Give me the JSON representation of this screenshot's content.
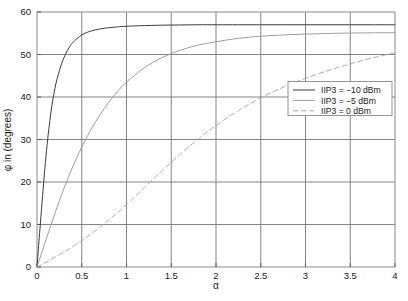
{
  "chart_data": {
    "type": "line",
    "title": "",
    "xlabel": "α",
    "ylabel": "φ in (degrees)",
    "xlim": [
      0,
      4
    ],
    "ylim": [
      0,
      60
    ],
    "grid": true,
    "legend_position": "center-right",
    "xticks": [
      "0",
      "0.5",
      "1",
      "1.5",
      "2",
      "2.5",
      "3",
      "3.5",
      "4"
    ],
    "xtick_values": [
      0,
      0.5,
      1,
      1.5,
      2,
      2.5,
      3,
      3.5,
      4
    ],
    "yticks": [
      "0",
      "10",
      "20",
      "30",
      "40",
      "50",
      "60"
    ],
    "ytick_values": [
      0,
      10,
      20,
      30,
      40,
      50,
      60
    ],
    "x": [
      0,
      0.05,
      0.1,
      0.15,
      0.2,
      0.25,
      0.3,
      0.35,
      0.4,
      0.5,
      0.6,
      0.7,
      0.8,
      0.9,
      1.0,
      1.2,
      1.4,
      1.6,
      1.8,
      2.0,
      2.25,
      2.5,
      2.75,
      3.0,
      3.25,
      3.5,
      3.75,
      4.0
    ],
    "series": [
      {
        "name": "IIP3 = −10 dBm",
        "style": "solid",
        "color": "#3c3c3c",
        "values": [
          0,
          13.5,
          26.0,
          35.5,
          42.0,
          46.2,
          49.2,
          51.3,
          52.8,
          54.6,
          55.5,
          56.0,
          56.3,
          56.5,
          56.65,
          56.8,
          56.9,
          56.95,
          57.0,
          57.0,
          57.0,
          57.0,
          57.0,
          57.0,
          57.0,
          57.0,
          57.0,
          57.0
        ]
      },
      {
        "name": "IIP3 = −5 dBm",
        "style": "solid",
        "color": "#9a9a9a",
        "values": [
          0,
          3.2,
          6.4,
          9.5,
          12.6,
          15.6,
          18.4,
          21.1,
          23.6,
          28.2,
          32.2,
          35.7,
          38.7,
          41.3,
          43.5,
          46.9,
          49.3,
          51.0,
          52.2,
          53.0,
          53.8,
          54.3,
          54.6,
          54.8,
          54.95,
          55.05,
          55.1,
          55.15
        ]
      },
      {
        "name": "IIP3 = 0 dBm",
        "style": "dashed",
        "color": "#a8a8a8",
        "values": [
          0,
          0.55,
          1.1,
          1.7,
          2.3,
          2.9,
          3.5,
          4.1,
          4.8,
          6.2,
          7.7,
          9.3,
          11.0,
          12.8,
          14.7,
          18.7,
          22.7,
          26.5,
          30.1,
          33.3,
          36.8,
          39.8,
          42.3,
          44.4,
          46.2,
          47.8,
          49.2,
          50.4
        ]
      }
    ],
    "legend_entries": [
      {
        "label": "IIP3 = −10 dBm",
        "style": "solid",
        "color": "#3c3c3c"
      },
      {
        "label": "IIP3 = −5 dBm",
        "style": "solid",
        "color": "#9a9a9a"
      },
      {
        "label": "IIP3 = 0 dBm",
        "style": "dashed",
        "color": "#a8a8a8"
      }
    ]
  },
  "axes": {
    "x_label": "α",
    "y_label": "φ in (degrees)"
  },
  "ticks": {
    "x": [
      "0",
      "0.5",
      "1",
      "1.5",
      "2",
      "2.5",
      "3",
      "3.5",
      "4"
    ],
    "y": [
      "0",
      "10",
      "20",
      "30",
      "40",
      "50",
      "60"
    ]
  },
  "legend": {
    "items": [
      {
        "label": "IIP3 = −10 dBm"
      },
      {
        "label": "IIP3 = −5 dBm"
      },
      {
        "label": "IIP3 = 0 dBm"
      }
    ]
  },
  "colors": {
    "curve_iip3_minus10": "#3c3c3c",
    "curve_iip3_minus5": "#9a9a9a",
    "curve_iip3_zero": "#a8a8a8",
    "grid": "#6f6f6f",
    "frame": "#8a8a8a",
    "background": "#ffffff"
  }
}
